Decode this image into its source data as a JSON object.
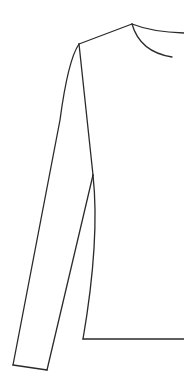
{
  "figure": {
    "stroke_color": "#2a2a2a",
    "background": "#ffffff",
    "parts": [
      {
        "name": "shoulder-line",
        "path": "M79 44 L132 24"
      },
      {
        "name": "neckline-back",
        "path": "M132 24 Q152 32 184 33"
      },
      {
        "name": "neckline-front",
        "path": "M132 24 Q140 52 172 57"
      },
      {
        "name": "sleeve-outer-edge",
        "path": "M79 44 Q68 60 60 120 L13 365"
      },
      {
        "name": "sleeve-cuff",
        "path": "M13 365 L47 370"
      },
      {
        "name": "sleeve-inner-edge",
        "path": "M47 370 L93 175"
      },
      {
        "name": "armhole-seam",
        "path": "M79 44 L93 175"
      },
      {
        "name": "body-side-seam",
        "path": "M93 175 Q100 240 83 339"
      },
      {
        "name": "hem-line",
        "path": "M83 339 L184 339"
      }
    ]
  }
}
